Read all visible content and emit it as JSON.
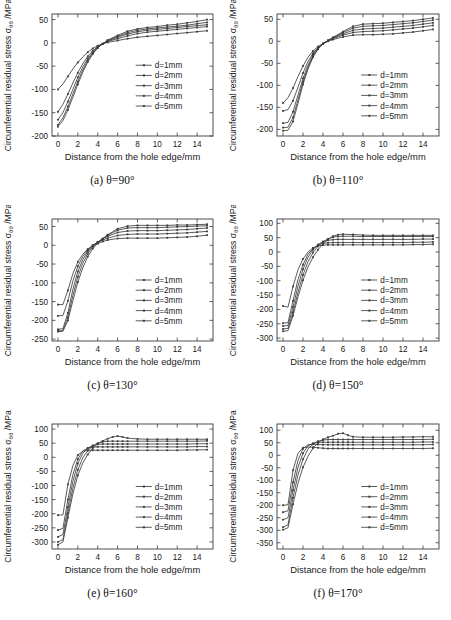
{
  "figure": {
    "name": "circumferential-residual-stress-subplots",
    "panel_count": 6,
    "common": {
      "xlabel": "Distance from the hole edge/mm",
      "ylabel_prefix": "Circumferential residual stress ",
      "ylabel_symbol": "σ",
      "ylabel_subscript": "θθ",
      "ylabel_suffix": " /MPa",
      "ylabel_full": "Circumferential residual stress σθθ /MPa",
      "xticks": [
        0,
        2,
        4,
        6,
        8,
        10,
        12,
        14
      ],
      "xlim": [
        -0.6,
        15.6
      ],
      "legend_entries": [
        "d=1mm",
        "d=2mm",
        "d=3mm",
        "d=4mm",
        "d=5mm"
      ],
      "line_color": "#3d3d3d",
      "axis_color": "#3a3a3a"
    }
  },
  "chart_data": [
    {
      "type": "line",
      "id": "panel-a",
      "caption": "(a) θ=90°",
      "title": "",
      "xlabel": "Distance from the hole edge/mm",
      "ylabel": "Circumferential residual stress σθθ /MPa",
      "xlim": [
        -0.6,
        15.6
      ],
      "ylim": [
        -200,
        62
      ],
      "yticks": [
        50,
        0,
        -50,
        -100,
        -150,
        -200
      ],
      "xticks": [
        0,
        2,
        4,
        6,
        8,
        10,
        12,
        14
      ],
      "grid": false,
      "legend_position": "center-right",
      "x": [
        0,
        0.5,
        1,
        1.5,
        2,
        2.5,
        3,
        3.5,
        4,
        4.5,
        5,
        6,
        7,
        8,
        9,
        10,
        11,
        12,
        13,
        14,
        15
      ],
      "series": [
        {
          "name": "d=1mm",
          "values": [
            -100,
            -88,
            -72,
            -56,
            -42,
            -30,
            -20,
            -12,
            -6,
            -2,
            1,
            5,
            9,
            12,
            14,
            16,
            18,
            20,
            22,
            24,
            26
          ]
        },
        {
          "name": "d=2mm",
          "values": [
            -148,
            -132,
            -110,
            -86,
            -64,
            -45,
            -29,
            -17,
            -8,
            -2,
            3,
            9,
            15,
            20,
            23,
            25,
            27,
            29,
            31,
            33,
            35
          ]
        },
        {
          "name": "d=3mm",
          "values": [
            -165,
            -150,
            -126,
            -100,
            -74,
            -52,
            -34,
            -20,
            -9,
            -2,
            4,
            12,
            19,
            24,
            27,
            29,
            31,
            33,
            35,
            37,
            39
          ]
        },
        {
          "name": "d=4mm",
          "values": [
            -176,
            -161,
            -137,
            -110,
            -83,
            -58,
            -38,
            -22,
            -10,
            -2,
            5,
            14,
            22,
            27,
            30,
            32,
            34,
            36,
            38,
            41,
            44
          ]
        },
        {
          "name": "d=5mm",
          "values": [
            -180,
            -167,
            -144,
            -117,
            -89,
            -63,
            -41,
            -24,
            -11,
            -2,
            6,
            16,
            25,
            30,
            33,
            35,
            38,
            40,
            43,
            46,
            50
          ]
        }
      ]
    },
    {
      "type": "line",
      "id": "panel-b",
      "caption": "(b) θ=110°",
      "title": "",
      "xlabel": "Distance from the hole edge/mm",
      "ylabel": "Circumferential residual stress σθθ /MPa",
      "xlim": [
        -0.6,
        15.6
      ],
      "ylim": [
        -215,
        62
      ],
      "yticks": [
        50,
        0,
        -50,
        -100,
        -150,
        -200
      ],
      "xticks": [
        0,
        2,
        4,
        6,
        8,
        10,
        12,
        14
      ],
      "grid": false,
      "legend_position": "center-right",
      "x": [
        0,
        0.5,
        1,
        1.5,
        2,
        2.5,
        3,
        3.5,
        4,
        4.5,
        5,
        6,
        7,
        8,
        9,
        10,
        11,
        12,
        13,
        14,
        15
      ],
      "series": [
        {
          "name": "d=1mm",
          "values": [
            -140,
            -128,
            -106,
            -80,
            -56,
            -36,
            -22,
            -12,
            -5,
            0,
            4,
            10,
            14,
            15,
            15,
            16,
            17,
            19,
            21,
            24,
            27
          ]
        },
        {
          "name": "d=2mm",
          "values": [
            -158,
            -155,
            -135,
            -104,
            -72,
            -46,
            -27,
            -14,
            -5,
            1,
            6,
            14,
            20,
            22,
            23,
            24,
            26,
            28,
            30,
            33,
            36
          ]
        },
        {
          "name": "d=3mm",
          "values": [
            -186,
            -184,
            -160,
            -122,
            -84,
            -54,
            -31,
            -16,
            -6,
            1,
            7,
            17,
            25,
            28,
            29,
            30,
            32,
            34,
            36,
            39,
            42
          ]
        },
        {
          "name": "d=4mm",
          "values": [
            -196,
            -195,
            -173,
            -133,
            -92,
            -59,
            -34,
            -17,
            -6,
            2,
            8,
            20,
            30,
            34,
            35,
            36,
            38,
            40,
            42,
            45,
            48
          ]
        },
        {
          "name": "d=5mm",
          "values": [
            -203,
            -202,
            -182,
            -141,
            -98,
            -63,
            -36,
            -18,
            -6,
            2,
            9,
            22,
            34,
            39,
            40,
            41,
            43,
            45,
            47,
            50,
            53
          ]
        }
      ]
    },
    {
      "type": "line",
      "id": "panel-c",
      "caption": "(c) θ=130°",
      "title": "",
      "xlabel": "Distance from the hole edge/mm",
      "ylabel": "Circumferential residual stress σθθ /MPa",
      "xlim": [
        -0.6,
        15.6
      ],
      "ylim": [
        -255,
        70
      ],
      "yticks": [
        50,
        0,
        -50,
        -100,
        -150,
        -200,
        -250
      ],
      "xticks": [
        0,
        2,
        4,
        6,
        8,
        10,
        12,
        14
      ],
      "grid": false,
      "legend_position": "center-right",
      "x": [
        0,
        0.5,
        1,
        1.5,
        2,
        2.5,
        3,
        3.5,
        4,
        4.5,
        5,
        6,
        7,
        8,
        9,
        10,
        11,
        12,
        13,
        14,
        15
      ],
      "series": [
        {
          "name": "d=1mm",
          "values": [
            -158,
            -158,
            -120,
            -76,
            -44,
            -24,
            -10,
            -1,
            5,
            10,
            14,
            18,
            19,
            19,
            19,
            19,
            20,
            21,
            22,
            24,
            27
          ]
        },
        {
          "name": "d=2mm",
          "values": [
            -188,
            -187,
            -148,
            -96,
            -56,
            -30,
            -12,
            0,
            8,
            14,
            19,
            26,
            29,
            30,
            30,
            30,
            31,
            32,
            33,
            35,
            37
          ]
        },
        {
          "name": "d=3mm",
          "values": [
            -224,
            -222,
            -180,
            -118,
            -70,
            -38,
            -16,
            -1,
            9,
            17,
            24,
            34,
            38,
            39,
            39,
            39,
            40,
            41,
            42,
            44,
            46
          ]
        },
        {
          "name": "d=4mm",
          "values": [
            -228,
            -227,
            -192,
            -134,
            -84,
            -48,
            -22,
            -4,
            8,
            18,
            27,
            40,
            46,
            47,
            47,
            47,
            48,
            49,
            50,
            51,
            52
          ]
        },
        {
          "name": "d=5mm",
          "values": [
            -230,
            -229,
            -200,
            -148,
            -98,
            -60,
            -30,
            -9,
            5,
            17,
            28,
            44,
            51,
            53,
            53,
            53,
            53,
            54,
            54,
            55,
            56
          ]
        }
      ]
    },
    {
      "type": "line",
      "id": "panel-d",
      "caption": "(d) θ=150°",
      "title": "",
      "xlabel": "Distance from the hole edge/mm",
      "ylabel": "Circumferential residual stress σθθ /MPa",
      "xlim": [
        -0.6,
        15.6
      ],
      "ylim": [
        -310,
        115
      ],
      "yticks": [
        100,
        50,
        0,
        -50,
        -100,
        -150,
        -200,
        -250,
        -300
      ],
      "xticks": [
        0,
        2,
        4,
        6,
        8,
        10,
        12,
        14
      ],
      "grid": false,
      "legend_position": "center-right",
      "x": [
        0,
        0.5,
        1,
        1.5,
        2,
        2.5,
        3,
        3.5,
        4,
        4.5,
        5,
        5.5,
        6,
        7,
        8,
        9,
        10,
        11,
        12,
        13,
        14,
        15
      ],
      "series": [
        {
          "name": "d=1mm",
          "values": [
            -188,
            -192,
            -120,
            -62,
            -24,
            0,
            14,
            21,
            24,
            25,
            25,
            25,
            25,
            25,
            25,
            25,
            25,
            25,
            25,
            26,
            26,
            27
          ]
        },
        {
          "name": "d=2mm",
          "values": [
            -248,
            -246,
            -170,
            -96,
            -44,
            -8,
            12,
            24,
            30,
            32,
            33,
            33,
            33,
            33,
            33,
            33,
            33,
            33,
            33,
            34,
            34,
            35
          ]
        },
        {
          "name": "d=3mm",
          "values": [
            -258,
            -256,
            -192,
            -118,
            -60,
            -18,
            8,
            26,
            36,
            41,
            43,
            44,
            44,
            44,
            44,
            44,
            44,
            44,
            44,
            44,
            45,
            45
          ]
        },
        {
          "name": "d=4mm",
          "values": [
            -268,
            -266,
            -210,
            -140,
            -80,
            -34,
            -2,
            20,
            36,
            46,
            52,
            54,
            55,
            55,
            54,
            54,
            54,
            54,
            54,
            54,
            54,
            54
          ]
        },
        {
          "name": "d=5mm",
          "values": [
            -276,
            -274,
            -222,
            -156,
            -98,
            -52,
            -18,
            8,
            28,
            44,
            55,
            60,
            62,
            61,
            59,
            58,
            58,
            58,
            58,
            58,
            58,
            58
          ]
        }
      ]
    },
    {
      "type": "line",
      "id": "panel-e",
      "caption": "(e) θ=160°",
      "title": "",
      "xlabel": "Distance from the hole edge/mm",
      "ylabel": "Circumferential residual stress σθθ /MPa",
      "xlim": [
        -0.6,
        15.6
      ],
      "ylim": [
        -325,
        118
      ],
      "yticks": [
        100,
        50,
        0,
        -50,
        -100,
        -150,
        -200,
        -250,
        -300
      ],
      "xticks": [
        0,
        2,
        4,
        6,
        8,
        10,
        12,
        14
      ],
      "grid": false,
      "legend_position": "center-right",
      "x": [
        0,
        0.5,
        1,
        1.5,
        2,
        2.5,
        3,
        3.5,
        4,
        4.5,
        5,
        5.5,
        6,
        6.5,
        7,
        8,
        9,
        10,
        11,
        12,
        13,
        14,
        15
      ],
      "series": [
        {
          "name": "d=1mm",
          "values": [
            -205,
            -204,
            -96,
            -30,
            8,
            22,
            25,
            25,
            25,
            25,
            25,
            25,
            25,
            25,
            25,
            25,
            25,
            25,
            25,
            25,
            26,
            26,
            27
          ]
        },
        {
          "name": "d=2mm",
          "values": [
            -258,
            -252,
            -150,
            -62,
            -6,
            22,
            33,
            36,
            37,
            37,
            37,
            37,
            37,
            37,
            37,
            37,
            37,
            37,
            37,
            37,
            37,
            38,
            38
          ]
        },
        {
          "name": "d=3mm",
          "values": [
            -282,
            -274,
            -176,
            -86,
            -22,
            14,
            33,
            42,
            46,
            47,
            47,
            47,
            47,
            47,
            47,
            47,
            47,
            47,
            47,
            47,
            47,
            48,
            48
          ]
        },
        {
          "name": "d=4mm",
          "values": [
            -300,
            -292,
            -198,
            -110,
            -44,
            -2,
            24,
            40,
            50,
            55,
            57,
            57,
            57,
            57,
            57,
            57,
            57,
            57,
            57,
            57,
            57,
            57,
            58
          ]
        },
        {
          "name": "d=5mm",
          "values": [
            -310,
            -300,
            -214,
            -130,
            -64,
            -20,
            10,
            32,
            48,
            58,
            66,
            72,
            75,
            72,
            68,
            65,
            64,
            64,
            64,
            64,
            64,
            64,
            64
          ]
        }
      ]
    },
    {
      "type": "line",
      "id": "panel-f",
      "caption": "(f) θ=170°",
      "title": "",
      "xlabel": "Distance from the hole edge/mm",
      "ylabel": "Circumferential residual stress σθθ /MPa",
      "xlim": [
        -0.6,
        15.6
      ],
      "ylim": [
        -375,
        125
      ],
      "yticks": [
        100,
        50,
        0,
        -50,
        -100,
        -150,
        -200,
        -250,
        -300,
        -350
      ],
      "xticks": [
        0,
        2,
        4,
        6,
        8,
        10,
        12,
        14
      ],
      "grid": false,
      "legend_position": "center-right",
      "x": [
        0,
        0.5,
        1,
        1.5,
        2,
        2.5,
        3,
        3.5,
        4,
        4.5,
        5,
        5.5,
        6,
        6.5,
        7,
        8,
        9,
        10,
        11,
        12,
        13,
        14,
        15
      ],
      "series": [
        {
          "name": "d=1mm",
          "values": [
            -200,
            -198,
            -60,
            8,
            30,
            33,
            32,
            30,
            28,
            27,
            27,
            27,
            27,
            27,
            27,
            27,
            27,
            27,
            27,
            27,
            27,
            27,
            28
          ]
        },
        {
          "name": "d=2mm",
          "values": [
            -228,
            -222,
            -108,
            -20,
            26,
            42,
            44,
            43,
            42,
            42,
            42,
            42,
            42,
            42,
            42,
            42,
            42,
            42,
            42,
            42,
            42,
            42,
            43
          ]
        },
        {
          "name": "d=3mm",
          "values": [
            -258,
            -250,
            -140,
            -48,
            8,
            38,
            48,
            51,
            52,
            52,
            52,
            52,
            52,
            52,
            52,
            52,
            52,
            52,
            52,
            52,
            52,
            53,
            53
          ]
        },
        {
          "name": "d=4mm",
          "values": [
            -288,
            -278,
            -170,
            -78,
            -16,
            24,
            46,
            56,
            61,
            63,
            63,
            63,
            63,
            63,
            63,
            63,
            63,
            63,
            63,
            63,
            63,
            63,
            64
          ]
        },
        {
          "name": "d=5mm",
          "values": [
            -298,
            -290,
            -196,
            -112,
            -48,
            -4,
            28,
            50,
            64,
            72,
            78,
            86,
            88,
            80,
            74,
            72,
            72,
            72,
            72,
            73,
            73,
            74,
            74
          ]
        }
      ]
    }
  ]
}
